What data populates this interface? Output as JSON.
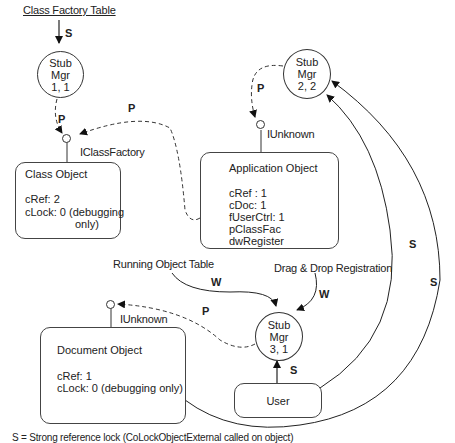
{
  "diagram": {
    "class_factory_table": "Class Factory Table",
    "running_object_table": "Running Object Table",
    "drag_drop_registration": "Drag & Drop Registration",
    "stub_managers": [
      {
        "line1": "Stub",
        "line2": "Mgr",
        "line3": "1, 1"
      },
      {
        "line1": "Stub",
        "line2": "Mgr",
        "line3": "2, 2"
      },
      {
        "line1": "Stub",
        "line2": "Mgr",
        "line3": "3, 1"
      }
    ],
    "interfaces": {
      "class_factory": "IClassFactory",
      "app_unknown": "IUnknown",
      "doc_unknown": "IUnknown"
    },
    "class_object": {
      "title": "Class Object",
      "fields": [
        "cRef: 2",
        "cLock: 0 (debugging",
        "only)"
      ]
    },
    "application_object": {
      "title": "Application Object",
      "fields": [
        "cRef : 1",
        "cDoc: 1",
        "fUserCtrl: 1",
        "pClassFac",
        "dwRegister"
      ]
    },
    "document_object": {
      "title": "Document Object",
      "fields": [
        "cRef: 1",
        "cLock: 0 (debugging only)"
      ]
    },
    "user": {
      "label": "User"
    },
    "edge_labels": {
      "s_cft": "S",
      "p_stub1": "P",
      "p_app_to_cf": "P",
      "p_stub2": "P",
      "w_rot": "W",
      "w_dd": "W",
      "p_doc": "P",
      "s_user": "S",
      "s_arc_inner": "S",
      "s_arc_outer": "S"
    },
    "legend": "S = Strong reference lock (CoLockObjectExternal called on object)"
  }
}
